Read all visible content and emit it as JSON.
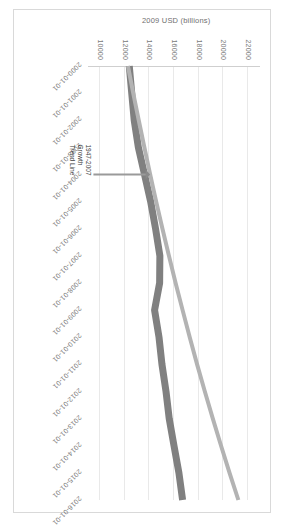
{
  "chart_data": {
    "type": "line",
    "title": "",
    "xlabel": "",
    "ylabel": "2009 USD (billions)",
    "ylim": [
      9000,
      23000
    ],
    "yticks": [
      10000,
      12000,
      14000,
      16000,
      18000,
      20000,
      22000
    ],
    "ytick_labels": [
      "10000",
      "12000",
      "14000",
      "16000",
      "18000",
      "20000",
      "22000"
    ],
    "grid": true,
    "legend_position": "none",
    "rotation_degrees": 90,
    "x": [
      "2000-01-01",
      "2001-01-01",
      "2002-01-01",
      "2003-01-01",
      "2004-01-01",
      "2005-01-01",
      "2006-01-01",
      "2007-01-01",
      "2008-01-01",
      "2009-01-01",
      "2010-01-01",
      "2011-01-01",
      "2012-01-01",
      "2013-01-01",
      "2014-01-01",
      "2015-01-01",
      "2016-01-01"
    ],
    "xtick_labels": [
      "2000-01-01",
      "2001-01-01",
      "2002-01-01",
      "2003-01-01",
      "2004-01-01",
      "2005-01-01",
      "2006-01-01",
      "2007-01-01",
      "2008-01-01",
      "2009-01-01",
      "2010-01-01",
      "2011-01-01",
      "2012-01-01",
      "2013-01-01",
      "2014-01-01",
      "2015-01-01",
      "2016-01-01"
    ],
    "series": [
      {
        "name": "Real GDP",
        "color": "#808080",
        "style": "solid",
        "values": [
          12360,
          12560,
          12760,
          13100,
          13600,
          14100,
          14500,
          14850,
          14830,
          14420,
          14780,
          15020,
          15350,
          15610,
          16000,
          16400,
          16700
        ]
      },
      {
        "name": "1947-2007 Growth Trend Line",
        "color": "#b3b3b3",
        "style": "solid",
        "values": [
          12250,
          12680,
          13130,
          13590,
          14060,
          14550,
          15060,
          15590,
          16130,
          16700,
          17280,
          17880,
          18510,
          19160,
          19830,
          20520,
          21240
        ]
      }
    ],
    "annotations": [
      {
        "name": "trend-line-annotation",
        "text": "1947-2007\nGrowth\nTrend Line",
        "arrow": true
      }
    ]
  }
}
